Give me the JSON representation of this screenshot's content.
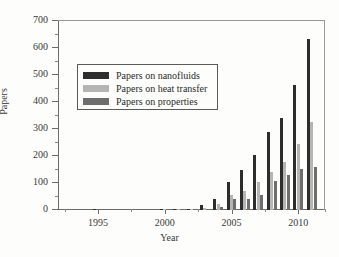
{
  "chart_data": {
    "type": "bar",
    "title": "",
    "xlabel": "Year",
    "ylabel": "Papers",
    "ylim": [
      0,
      700
    ],
    "ytick_step": 100,
    "yticks": [
      0,
      100,
      200,
      300,
      400,
      500,
      600,
      700
    ],
    "xlim": [
      1992,
      2012
    ],
    "xticks": [
      1995,
      2000,
      2005,
      2010
    ],
    "grid": false,
    "legend_position": "upper left",
    "categories": [
      1992,
      1993,
      1994,
      1995,
      1996,
      1997,
      1998,
      1999,
      2000,
      2001,
      2002,
      2003,
      2004,
      2005,
      2006,
      2007,
      2008,
      2009,
      2010,
      2011
    ],
    "series": [
      {
        "name": "Papers on nanofluids",
        "color": "#2d2d2d",
        "values": [
          0,
          0,
          0,
          1,
          0,
          0,
          0,
          0,
          1,
          2,
          3,
          18,
          40,
          104,
          148,
          203,
          288,
          339,
          464,
          632
        ]
      },
      {
        "name": "Papers on heat transfer",
        "color": "#b5b5b5",
        "values": [
          0,
          0,
          0,
          0,
          0,
          0,
          0,
          0,
          1,
          1,
          1,
          9,
          24,
          54,
          70,
          102,
          139,
          176,
          243,
          325
        ]
      },
      {
        "name": "Papers on properties",
        "color": "#6e6e6e",
        "values": [
          0,
          0,
          0,
          0,
          0,
          0,
          0,
          0,
          0,
          1,
          1,
          5,
          10,
          39,
          41,
          57,
          108,
          131,
          151,
          158
        ]
      }
    ]
  },
  "legend": {
    "items": [
      {
        "label": "Papers on nanofluids",
        "swatch": "#2d2d2d"
      },
      {
        "label": "Papers on heat transfer",
        "swatch": "#b5b5b5"
      },
      {
        "label": "Papers on properties",
        "swatch": "#6e6e6e"
      }
    ]
  },
  "axes": {
    "y_title": "Papers",
    "x_title": "Year",
    "y_tick_labels": [
      "0",
      "100",
      "200",
      "300",
      "400",
      "500",
      "600",
      "700"
    ],
    "x_tick_labels": [
      "1995",
      "2000",
      "2005",
      "2010"
    ]
  }
}
